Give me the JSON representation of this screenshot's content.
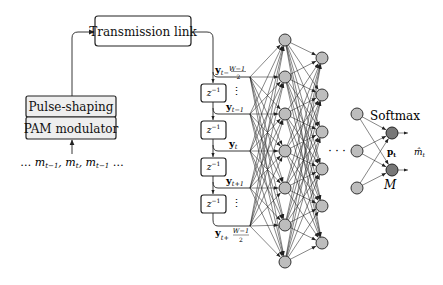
{
  "diagram": {
    "transmitter": {
      "pulse_shaping_label": "Pulse-shaping",
      "pam_label": "PAM modulator",
      "input_sequence": "… m",
      "input_sub": [
        "t−1",
        "t",
        "t−1"
      ]
    },
    "channel": {
      "label": "Transmission link"
    },
    "delay_line": {
      "delay_label": "z",
      "delay_exp": "−1",
      "delay_count": 4,
      "taps": [
        {
          "base": "y",
          "sub": "t− (W−1)/2"
        },
        {
          "base": "y",
          "sub": "t−1"
        },
        {
          "base": "y",
          "sub": "t"
        },
        {
          "base": "y",
          "sub": "t+1"
        },
        {
          "base": "y",
          "sub": "t+ (W−1)/2"
        }
      ],
      "vdots": "⋮"
    },
    "network": {
      "layer1_nodes": 7,
      "layer2_nodes": 6,
      "last_hidden_nodes": 3,
      "output_nodes": 2,
      "ellipsis": "· · ·",
      "softmax_label": "Softmax",
      "p_label": "p",
      "p_sub": "t",
      "M_label": "M",
      "output_label": "m̂",
      "output_sub": "t"
    },
    "colors": {
      "hidden_node": "#bdbdbd",
      "output_node": "#777777",
      "transmitter_box": "#eeeeee"
    }
  }
}
